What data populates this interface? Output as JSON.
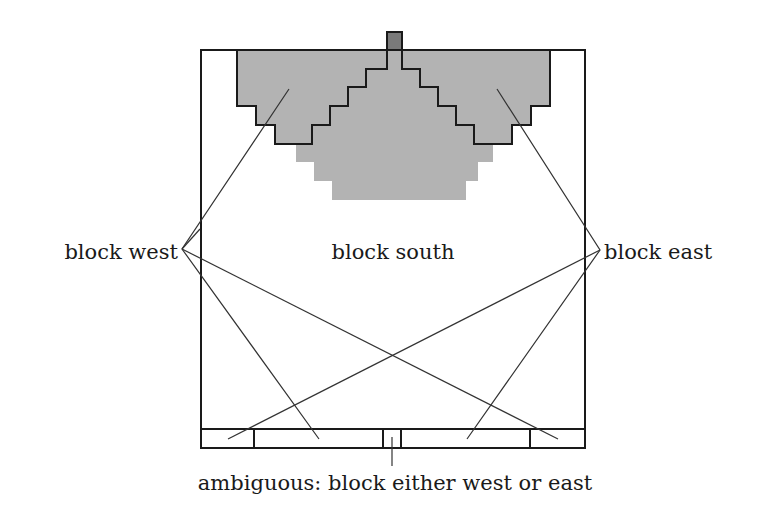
{
  "diagram": {
    "labels": {
      "west": "block west",
      "south": "block south",
      "east": "block east",
      "ambiguous": "ambiguous: block either west or east"
    },
    "colors": {
      "region_fill": "#b3b3b3",
      "marker_fill": "#7a7a7a",
      "outline": "#1a1a1a",
      "background": "#ffffff"
    },
    "regions": [
      "block west",
      "block south",
      "block east"
    ],
    "bottom_strip_segments": 6
  }
}
